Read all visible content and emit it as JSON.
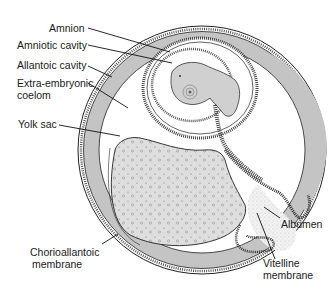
{
  "figure": {
    "labels": {
      "amnion": "Amnion",
      "amniotic_cavity": "Amniotic cavity",
      "allantoic_cavity": "Allantoic cavity",
      "extra_embryonic_coelom_1": "Extra-embryonic",
      "extra_embryonic_coelom_2": "coelom",
      "yolk_sac": "Yolk sac",
      "chorioallantoic_1": "Chorioallantoic",
      "chorioallantoic_2": "membrane",
      "albumen": "Albumen",
      "vitelline_1": "Vitelline",
      "vitelline_2": "membrane"
    },
    "colors": {
      "membrane_gray": "#c4c4c4",
      "yolk": "#dcdcdc",
      "embryo": "#d0d0d0",
      "line": "#222222",
      "albumen": "#efefef"
    }
  }
}
